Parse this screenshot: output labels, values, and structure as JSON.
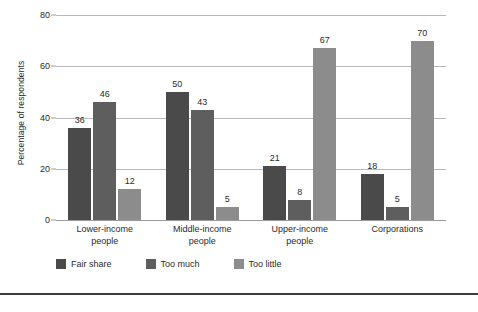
{
  "chart_data": {
    "type": "bar",
    "title": "",
    "xlabel": "",
    "ylabel": "Percentage of respondents",
    "ylim": [
      0,
      80
    ],
    "yticks": [
      0,
      20,
      40,
      60,
      80
    ],
    "grid": "horizontal",
    "legend_position": "bottom-left",
    "categories": [
      "Lower-income people",
      "Middle-income people",
      "Upper-income people",
      "Corporations"
    ],
    "category_lines": [
      [
        "Lower-income",
        "people"
      ],
      [
        "Middle-income",
        "people"
      ],
      [
        "Upper-income",
        "people"
      ],
      [
        "Corporations"
      ]
    ],
    "series": [
      {
        "name": "Fair share",
        "color": "#4a4a4a",
        "values": [
          36,
          50,
          21,
          18
        ]
      },
      {
        "name": "Too much",
        "color": "#5e5e5e",
        "values": [
          46,
          43,
          8,
          5
        ]
      },
      {
        "name": "Too little",
        "color": "#8c8c8c",
        "values": [
          12,
          5,
          67,
          70
        ]
      }
    ]
  }
}
